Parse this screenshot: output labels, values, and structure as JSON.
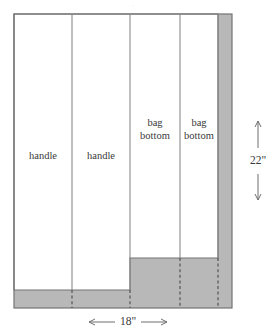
{
  "figure": {
    "colors": {
      "fabric_fill": "#ffffff",
      "waste_fill": "#b8b8b8",
      "outline_stroke": "#737373",
      "divider_stroke": "#8a8a8a",
      "dashed_stroke": "#4a4a4a",
      "text": "#3a3a3a",
      "arrow": "#6e6e6e"
    },
    "geometry": {
      "left": 14,
      "right": 232,
      "top": 14,
      "bottom": 308,
      "dividers_x": [
        72,
        130,
        180
      ],
      "right_waste_x": 218,
      "bottom_waste_y": 290,
      "mid_waste_y": 258,
      "mid_waste_x": 130,
      "dashed_x": [
        72,
        130,
        180,
        232
      ]
    }
  },
  "panels": [
    {
      "id": "panel-handle-1",
      "label": "handle",
      "lines": [
        "handle"
      ],
      "cx": 43,
      "cy": 157
    },
    {
      "id": "panel-handle-2",
      "label": "handle",
      "lines": [
        "handle"
      ],
      "cx": 101,
      "cy": 157
    },
    {
      "id": "panel-bag-bottom-1",
      "label": "bag bottom",
      "lines": [
        "bag",
        "bottom"
      ],
      "cx": 155,
      "cy": 130
    },
    {
      "id": "panel-bag-bottom-2",
      "label": "bag bottom",
      "lines": [
        "bag",
        "bottom"
      ],
      "cx": 199,
      "cy": 130
    }
  ],
  "dimensions": {
    "width": {
      "id": "dimension-width",
      "label": "18\"",
      "orientation": "horizontal",
      "x1": 89,
      "x2": 167,
      "y": 322,
      "label_x": 128,
      "label_y": 322
    },
    "height": {
      "id": "dimension-height",
      "label": "22\"",
      "orientation": "vertical",
      "y1": 121,
      "y2": 200,
      "x": 258,
      "label_x": 258,
      "label_y": 161
    }
  },
  "marks": {
    "top_artifact": "·"
  }
}
